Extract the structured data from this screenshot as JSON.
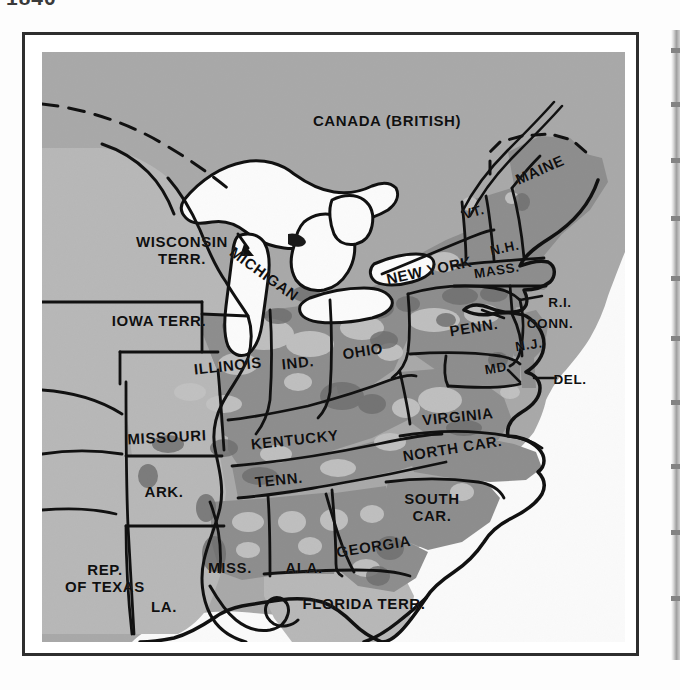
{
  "caption": {
    "year": "1840"
  },
  "map": {
    "title_region": "Eastern United States",
    "colors": {
      "ocean_and_unsettled": "#a8a8a8",
      "plate_background": "#b0b0b0",
      "territory_light": "#b9b9b9",
      "settled_medium": "#8f8f8f",
      "settled_dark": "#787878",
      "density_patch_light": "#c6c6c6",
      "lake_white": "#fbfbfb",
      "ink": "#111111",
      "frame": "#2e2e2e",
      "page": "#ffffff"
    },
    "labels": [
      {
        "id": "canada",
        "text": "CANADA (BRITISH)",
        "x": 345,
        "y": 68,
        "size": "sz-lg",
        "rot": ""
      },
      {
        "id": "maine",
        "text": "MAINE",
        "x": 500,
        "y": 128,
        "size": "sz-lg",
        "rot": "rot-n25"
      },
      {
        "id": "vermont",
        "text": "VT.",
        "x": 432,
        "y": 163,
        "size": "sz-md",
        "rot": "rot-n18"
      },
      {
        "id": "new-hampshire",
        "text": "N.H.",
        "x": 463,
        "y": 199,
        "size": "sz-md",
        "rot": "rot-n12"
      },
      {
        "id": "massachusetts",
        "text": "MASS.",
        "x": 455,
        "y": 222,
        "size": "sz-md",
        "rot": "rot-n10"
      },
      {
        "id": "new-york",
        "text": "NEW YORK",
        "x": 388,
        "y": 227,
        "size": "sz-lg",
        "rot": "rot-n12"
      },
      {
        "id": "rhode-island",
        "text": "R.I.",
        "x": 518,
        "y": 250,
        "size": "sz-md",
        "rot": ""
      },
      {
        "id": "connecticut",
        "text": "CONN.",
        "x": 508,
        "y": 271,
        "size": "sz-md",
        "rot": ""
      },
      {
        "id": "michigan",
        "text": "MICHIGAN",
        "x": 230,
        "y": 198,
        "size": "sz-lg",
        "rot": "rot-p38"
      },
      {
        "id": "wisconsin",
        "text": "WISCONSIN\nTERR.",
        "x": 140,
        "y": 198,
        "size": "sz-lg",
        "rot": ""
      },
      {
        "id": "iowa",
        "text": "IOWA TERR.",
        "x": 117,
        "y": 268,
        "size": "sz-lg",
        "rot": ""
      },
      {
        "id": "pennsylvania",
        "text": "PENN.",
        "x": 432,
        "y": 279,
        "size": "sz-lg",
        "rot": "rot-n10"
      },
      {
        "id": "new-jersey",
        "text": "N.J.",
        "x": 487,
        "y": 295,
        "size": "sz-md",
        "rot": "rot-n10"
      },
      {
        "id": "maryland",
        "text": "MD",
        "x": 454,
        "y": 318,
        "size": "sz-md",
        "rot": "rot-n10"
      },
      {
        "id": "delaware",
        "text": "DEL.",
        "x": 528,
        "y": 327,
        "size": "sz-md",
        "rot": ""
      },
      {
        "id": "ohio",
        "text": "OHIO",
        "x": 321,
        "y": 302,
        "size": "sz-lg",
        "rot": "rot-n10"
      },
      {
        "id": "indiana",
        "text": "IND.",
        "x": 256,
        "y": 312,
        "size": "sz-lg",
        "rot": "rot-n6"
      },
      {
        "id": "illinois",
        "text": "ILLINOIS",
        "x": 186,
        "y": 317,
        "size": "sz-lg",
        "rot": "rot-n6"
      },
      {
        "id": "virginia",
        "text": "VIRGINIA",
        "x": 416,
        "y": 368,
        "size": "sz-lg",
        "rot": "rot-n6"
      },
      {
        "id": "missouri",
        "text": "MISSOURI",
        "x": 125,
        "y": 387,
        "size": "sz-lg",
        "rot": "rot-n3"
      },
      {
        "id": "kentucky",
        "text": "KENTUCKY",
        "x": 253,
        "y": 392,
        "size": "sz-lg",
        "rot": "rot-n6"
      },
      {
        "id": "north-carolina",
        "text": "NORTH CAR.",
        "x": 411,
        "y": 404,
        "size": "sz-lg",
        "rot": "rot-n10"
      },
      {
        "id": "tennessee",
        "text": "TENN.",
        "x": 237,
        "y": 430,
        "size": "sz-lg",
        "rot": "rot-n6"
      },
      {
        "id": "arkansas",
        "text": "ARK.",
        "x": 122,
        "y": 439,
        "size": "sz-lg",
        "rot": ""
      },
      {
        "id": "south-carolina",
        "text": "SOUTH\nCAR.",
        "x": 390,
        "y": 455,
        "size": "sz-lg",
        "rot": ""
      },
      {
        "id": "georgia",
        "text": "GEORGIA",
        "x": 332,
        "y": 500,
        "size": "sz-lg",
        "rot": "rot-n10"
      },
      {
        "id": "mississippi",
        "text": "MISS.",
        "x": 188,
        "y": 515,
        "size": "sz-lg",
        "rot": ""
      },
      {
        "id": "alabama",
        "text": "ALA.",
        "x": 262,
        "y": 515,
        "size": "sz-lg",
        "rot": ""
      },
      {
        "id": "republic-texas",
        "text": "REP.\nOF TEXAS",
        "x": 63,
        "y": 526,
        "size": "sz-lg",
        "rot": ""
      },
      {
        "id": "louisiana",
        "text": "LA.",
        "x": 122,
        "y": 554,
        "size": "sz-lg",
        "rot": ""
      },
      {
        "id": "florida",
        "text": "FLORIDA TERR.",
        "x": 322,
        "y": 551,
        "size": "sz-lg",
        "rot": ""
      }
    ]
  }
}
